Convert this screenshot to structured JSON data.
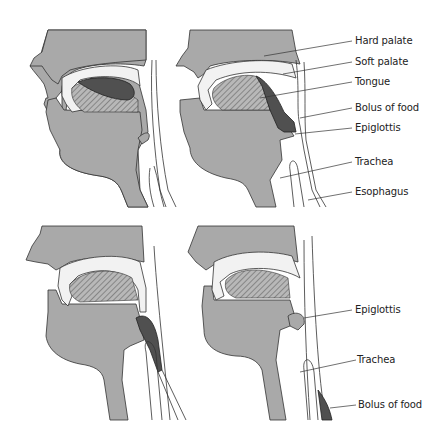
{
  "figure": {
    "colors": {
      "tissue": "#a9a9a9",
      "bolus": "#505050",
      "outline": "#333333",
      "background": "#ffffff",
      "cavity": "#f2f2f2"
    },
    "panels": [
      {
        "id": "panel-1",
        "position": "top-left",
        "labels": []
      },
      {
        "id": "panel-2",
        "position": "top-right",
        "labels": [
          {
            "text": "Hard palate"
          },
          {
            "text": "Soft palate"
          },
          {
            "text": "Tongue"
          },
          {
            "text": "Bolus of food"
          },
          {
            "text": "Epiglottis"
          },
          {
            "text": "Trachea"
          },
          {
            "text": "Esophagus"
          }
        ]
      },
      {
        "id": "panel-3",
        "position": "bottom-left",
        "labels": []
      },
      {
        "id": "panel-4",
        "position": "bottom-right",
        "labels": [
          {
            "text": "Epiglottis"
          },
          {
            "text": "Trachea"
          },
          {
            "text": "Bolus of food"
          }
        ]
      }
    ]
  }
}
